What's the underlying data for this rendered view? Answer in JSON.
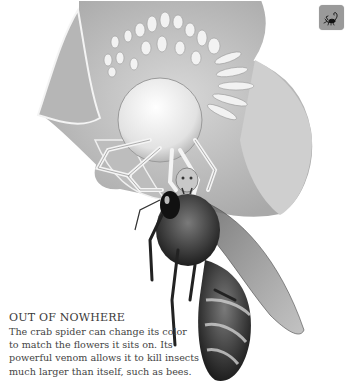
{
  "illustration": {
    "subject": "crab spider on a flower catching a honey bee",
    "style": "grayscale pencil drawing"
  },
  "corner_button": {
    "icon": "scorpion-icon",
    "background": "#9a9a9a"
  },
  "caption": {
    "title": "OUT OF NOWHERE",
    "lines": [
      "The crab spider can change its color",
      "to match the flowers it sits on. Its",
      "powerful venom allows it to kill insects",
      "much larger than itself, such as bees."
    ]
  },
  "colors": {
    "text": "#3a3a3a",
    "background": "#ffffff"
  }
}
